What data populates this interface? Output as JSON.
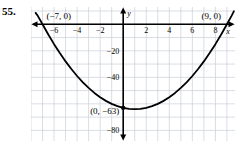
{
  "problem": {
    "number": "55."
  },
  "chart_data": {
    "type": "line",
    "title": "",
    "subtitle": "",
    "xlabel": "x",
    "ylabel": "y",
    "grid": true,
    "legend": false,
    "legend_position": "none",
    "function": "y = (x + 7)(x - 9) = x^2 - 2x - 63",
    "xlim": [
      -8,
      9.7
    ],
    "ylim": [
      -88,
      13
    ],
    "x_ticks": [
      -6,
      -4,
      -2,
      2,
      4,
      6,
      8
    ],
    "x_tick_labels": [
      "−6",
      "−4",
      "−2",
      "2",
      "4",
      "6",
      "8"
    ],
    "y_ticks": [
      -20,
      -40,
      -80
    ],
    "y_tick_labels": [
      "−20",
      "−40",
      "−80"
    ],
    "grid_step_x": 1,
    "grid_step_y": 10,
    "annotations": [
      {
        "name": "left-root",
        "text": "(−7, 0)",
        "x": -7,
        "y": 0
      },
      {
        "name": "right-root",
        "text": "(9, 0)",
        "x": 9,
        "y": 0
      },
      {
        "name": "y-intercept",
        "text": "(0, −63)",
        "x": 0,
        "y": -63
      }
    ],
    "points": [
      {
        "x": -7,
        "y": 0
      },
      {
        "x": 0,
        "y": -63
      },
      {
        "x": 1,
        "y": -64
      },
      {
        "x": 9,
        "y": 0
      }
    ],
    "curve": [
      {
        "x": -7.6,
        "y": 8.56
      },
      {
        "x": -7.4,
        "y": 6.16
      },
      {
        "x": -7.0,
        "y": 0.0
      },
      {
        "x": -6.5,
        "y": -7.75
      },
      {
        "x": -6.0,
        "y": -15.0
      },
      {
        "x": -5.5,
        "y": -21.75
      },
      {
        "x": -5.0,
        "y": -28.0
      },
      {
        "x": -4.5,
        "y": -33.75
      },
      {
        "x": -4.0,
        "y": -39.0
      },
      {
        "x": -3.5,
        "y": -43.75
      },
      {
        "x": -3.0,
        "y": -48.0
      },
      {
        "x": -2.5,
        "y": -51.75
      },
      {
        "x": -2.0,
        "y": -55.0
      },
      {
        "x": -1.5,
        "y": -57.75
      },
      {
        "x": -1.0,
        "y": -60.0
      },
      {
        "x": -0.5,
        "y": -61.75
      },
      {
        "x": 0.0,
        "y": -63.0
      },
      {
        "x": 0.5,
        "y": -63.75
      },
      {
        "x": 1.0,
        "y": -64.0
      },
      {
        "x": 1.5,
        "y": -63.75
      },
      {
        "x": 2.0,
        "y": -63.0
      },
      {
        "x": 2.5,
        "y": -61.75
      },
      {
        "x": 3.0,
        "y": -60.0
      },
      {
        "x": 3.5,
        "y": -57.75
      },
      {
        "x": 4.0,
        "y": -55.0
      },
      {
        "x": 4.5,
        "y": -51.75
      },
      {
        "x": 5.0,
        "y": -48.0
      },
      {
        "x": 5.5,
        "y": -43.75
      },
      {
        "x": 6.0,
        "y": -39.0
      },
      {
        "x": 6.5,
        "y": -33.75
      },
      {
        "x": 7.0,
        "y": -28.0
      },
      {
        "x": 7.5,
        "y": -21.75
      },
      {
        "x": 8.0,
        "y": -15.0
      },
      {
        "x": 8.5,
        "y": -7.75
      },
      {
        "x": 9.0,
        "y": 0.0
      },
      {
        "x": 9.4,
        "y": 6.36
      },
      {
        "x": 9.6,
        "y": 9.76
      }
    ]
  },
  "colors": {
    "grid": "#c9cfd8",
    "axis": "#000000",
    "curve": "#000000",
    "background": "#ffffff",
    "text": "#000000"
  }
}
